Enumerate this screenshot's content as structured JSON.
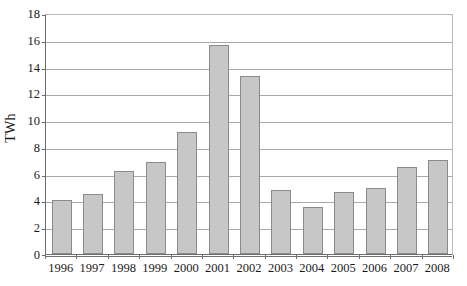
{
  "chart_data": {
    "type": "bar",
    "title": "",
    "subtitle": "",
    "xlabel": "",
    "ylabel": "TWh",
    "categories": [
      "1996",
      "1997",
      "1998",
      "1999",
      "2000",
      "2001",
      "2002",
      "2003",
      "2004",
      "2005",
      "2006",
      "2007",
      "2008"
    ],
    "values": [
      4.0,
      4.5,
      6.2,
      6.9,
      9.1,
      15.6,
      13.3,
      4.8,
      3.5,
      4.6,
      4.9,
      6.5,
      7.0
    ],
    "series": [
      {
        "name": "TWh",
        "values": [
          4.0,
          4.5,
          6.2,
          6.9,
          9.1,
          15.6,
          13.3,
          4.8,
          3.5,
          4.6,
          4.9,
          6.5,
          7.0
        ]
      }
    ],
    "ylim": [
      0,
      18
    ],
    "ytick_step": 2,
    "ytick_labels": [
      "0",
      "2",
      "4",
      "6",
      "8",
      "10",
      "12",
      "14",
      "16",
      "18"
    ],
    "grid": true,
    "grid_axis": "y",
    "legend": false,
    "legend_position": "none",
    "bar_fill_color": "#c7c7c7",
    "bar_border_color": "#8a8a8a",
    "gridline_color": "#a9a9a9",
    "axis_color": "#6e6e6e",
    "background_color": "#ffffff"
  }
}
